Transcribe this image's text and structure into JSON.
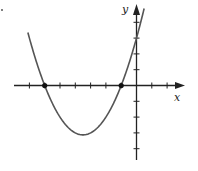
{
  "chart_data": {
    "type": "line",
    "title": "",
    "xlabel": "x",
    "ylabel": "y",
    "function": "y = 0.5(x + 6)(x + 1)",
    "x_ticks": [
      -7,
      -6,
      -5,
      -4,
      -3,
      -2,
      -1,
      1,
      2
    ],
    "y_ticks": [
      4,
      3,
      2,
      1,
      -1,
      -2,
      -3,
      -4
    ],
    "xlim": [
      -7.7,
      2.7
    ],
    "ylim": [
      -4.9,
      5.5
    ],
    "grid": false,
    "series": [
      {
        "name": "parabola",
        "x": [
          -7.1,
          -6,
          -5,
          -4,
          -3.5,
          -3,
          -2,
          -1,
          0,
          0.5
        ],
        "values": [
          3.8,
          0,
          -2,
          -3,
          -3.125,
          -3,
          -2,
          0,
          3,
          4.1
        ]
      }
    ],
    "marked_points": [
      {
        "x": -6,
        "y": 0,
        "label": "root"
      },
      {
        "x": -1,
        "y": 0,
        "label": "root"
      }
    ],
    "colors": {
      "curve": "#555555",
      "axes": "#222222",
      "points": "#111111"
    }
  },
  "labels": {
    "x": "x",
    "y": "y",
    "corner_mark": "."
  }
}
